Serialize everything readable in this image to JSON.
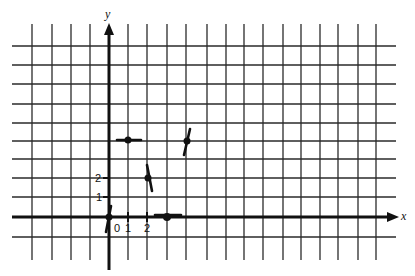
{
  "chart_data": {
    "type": "scatter",
    "title": "",
    "xlabel": "x",
    "ylabel": "y",
    "grid": true,
    "xlim": [
      -4,
      14
    ],
    "ylim": [
      -1,
      9
    ],
    "x_tick_labels": [
      "0",
      "1",
      "2"
    ],
    "y_tick_labels": [
      "1",
      "2"
    ],
    "points": [
      {
        "x": 0,
        "y": 0,
        "tangent": "steep-positive",
        "marker": "dot"
      },
      {
        "x": 1,
        "y": 4,
        "tangent": "horizontal",
        "marker": "dot"
      },
      {
        "x": 2,
        "y": 2,
        "tangent": "steep-negative",
        "marker": "dot"
      },
      {
        "x": 3,
        "y": 0,
        "tangent": "horizontal",
        "marker": "dot"
      },
      {
        "x": 4,
        "y": 4,
        "tangent": "steep-positive",
        "marker": "dot"
      }
    ]
  },
  "axes": {
    "x_label": "x",
    "y_label": "y",
    "x_ticks": [
      "0",
      "1",
      "2"
    ],
    "y_ticks": [
      "1",
      "2"
    ]
  },
  "colors": {
    "ink": "#111111",
    "grid": "#2a2a2a",
    "background": "#ffffff"
  }
}
